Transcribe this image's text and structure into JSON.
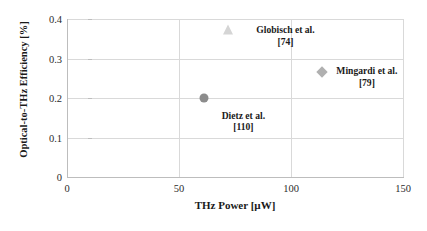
{
  "chart_data": {
    "type": "scatter",
    "title": "",
    "xlabel": "THz Power [µW]",
    "ylabel": "Optical-to-THz Efficiency [%]",
    "xlim": [
      0,
      150
    ],
    "ylim": [
      0,
      0.4
    ],
    "xticks": [
      "0",
      "50",
      "100",
      "150"
    ],
    "xtick_values": [
      0,
      50,
      100,
      150
    ],
    "yticks": [
      "0",
      "0.1",
      "0.2",
      "0.3",
      "0.4"
    ],
    "ytick_values": [
      0,
      0.1,
      0.2,
      0.3,
      0.4
    ],
    "grid": "horizontal-and-vertical",
    "legend": "none",
    "points": [
      {
        "label": "Globisch et al.",
        "reference": "[74]",
        "x": 72,
        "y": 0.372,
        "marker": "triangle",
        "color": "#d5d5d5",
        "label_dx": 28,
        "label_dy": -6
      },
      {
        "label": "Mingardi et al.",
        "reference": "[79]",
        "x": 114,
        "y": 0.266,
        "marker": "diamond",
        "color": "#b0b0b0",
        "label_dx": 14,
        "label_dy": -7
      },
      {
        "label": "Dietz et al.",
        "reference": "[110]",
        "x": 61,
        "y": 0.201,
        "marker": "circle",
        "color": "#8c8c8c",
        "label_dx": 18,
        "label_dy": 12
      }
    ]
  },
  "colors": {
    "gridline": "#d9d9d9",
    "axis": "#bdbdbd",
    "text": "#1a1a1a",
    "tick_text": "#2b2b2b",
    "background": "#ffffff"
  }
}
